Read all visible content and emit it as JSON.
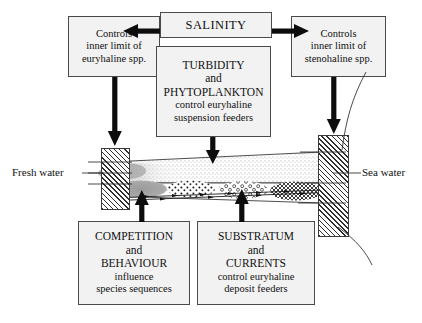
{
  "diagram": {
    "title_box": {
      "label": "SALINITY"
    },
    "left_box": {
      "lines": [
        "Controls",
        "inner limit of",
        "euryhaline spp."
      ]
    },
    "right_box": {
      "lines": [
        "Controls",
        "inner limit of",
        "stenohaline spp."
      ]
    },
    "turbidity_box": {
      "lines_major": [
        "TURBIDITY",
        "and",
        "PHYTOPLANKTON"
      ],
      "lines_minor": [
        "control euryhaline",
        "suspension feeders"
      ]
    },
    "competition_box": {
      "lines_major": [
        "COMPETITION",
        "and",
        "BEHAVIOUR"
      ],
      "lines_minor": [
        "influence",
        "species sequences"
      ]
    },
    "substratum_box": {
      "lines_major": [
        "SUBSTRATUM",
        "and",
        "CURRENTS"
      ],
      "lines_minor": [
        "control euryhaline",
        "deposit feeders"
      ]
    },
    "labels": {
      "fresh_water": "Fresh water",
      "sea_water": "Sea water"
    },
    "colors": {
      "box_fill": "#f2f2f2",
      "box_border": "#4a4a4a",
      "arrow": "#101010",
      "hatch": "#2e2e2e",
      "line": "#3a3a3a"
    }
  }
}
